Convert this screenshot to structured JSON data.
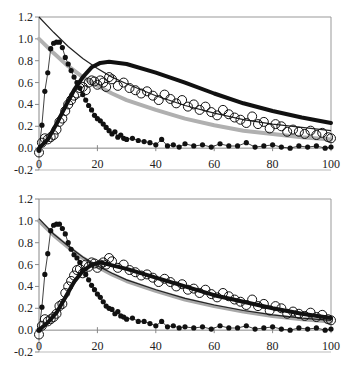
{
  "chart_data": [
    {
      "id": "top",
      "type": "line",
      "title": "",
      "xlabel": "",
      "ylabel": "",
      "xlim": [
        0,
        100
      ],
      "ylim": [
        -0.2,
        1.2
      ],
      "x_ticks": [
        0,
        20,
        40,
        60,
        80,
        100
      ],
      "y_ticks": [
        -0.2,
        0.0,
        0.2,
        0.4,
        0.6,
        0.8,
        1.0,
        1.2
      ],
      "y_tick_labels": [
        "-0.2",
        "0.0",
        "0.2",
        "0.4",
        "0.6",
        "0.8",
        "1.0",
        "1.2"
      ],
      "x_tick_labels": [
        "0",
        "20",
        "40",
        "60",
        "80",
        "100"
      ],
      "grid": false,
      "legend": null,
      "series": [
        {
          "name": "thin-black-decay",
          "style": "thin-line",
          "color": "#222222",
          "x": [
            0,
            5,
            10,
            15,
            20,
            25,
            30,
            40,
            50,
            60,
            70,
            80,
            90,
            100
          ],
          "values": [
            1.2,
            1.06,
            0.93,
            0.82,
            0.73,
            0.65,
            0.59,
            0.48,
            0.39,
            0.32,
            0.26,
            0.22,
            0.19,
            0.16
          ]
        },
        {
          "name": "gray-decay",
          "style": "thick-line",
          "color": "#b0b0b0",
          "x": [
            0,
            5,
            10,
            15,
            20,
            25,
            30,
            40,
            50,
            60,
            70,
            80,
            90,
            100
          ],
          "values": [
            1.0,
            0.87,
            0.75,
            0.65,
            0.57,
            0.5,
            0.44,
            0.35,
            0.27,
            0.21,
            0.16,
            0.13,
            0.1,
            0.08
          ]
        },
        {
          "name": "thick-black-rise-decay",
          "style": "thick-line",
          "color": "#111111",
          "x": [
            0,
            3,
            6,
            9,
            12,
            15,
            18,
            21,
            24,
            30,
            40,
            50,
            60,
            70,
            80,
            90,
            100
          ],
          "values": [
            0.0,
            0.08,
            0.22,
            0.38,
            0.53,
            0.65,
            0.74,
            0.78,
            0.79,
            0.77,
            0.69,
            0.6,
            0.5,
            0.41,
            0.34,
            0.28,
            0.23
          ]
        },
        {
          "name": "filled-dots-fast",
          "style": "filled-dots-line",
          "color": "#111111",
          "x": [
            0,
            1,
            2,
            3,
            4,
            5,
            6,
            7,
            8,
            9,
            10,
            11,
            12,
            13,
            14,
            15,
            16,
            17,
            18,
            19,
            20,
            21,
            22,
            23,
            24,
            25,
            26,
            27,
            28,
            29,
            30,
            32,
            34,
            36,
            38,
            40,
            42,
            44,
            46,
            48,
            50,
            53,
            56,
            59,
            62,
            65,
            68,
            71,
            74,
            77,
            80,
            83,
            86,
            89,
            92,
            95,
            98,
            100
          ],
          "values": [
            -0.02,
            0.21,
            0.52,
            0.69,
            0.91,
            0.96,
            0.97,
            0.97,
            0.92,
            0.83,
            0.77,
            0.71,
            0.65,
            0.6,
            0.55,
            0.49,
            0.44,
            0.39,
            0.35,
            0.3,
            0.27,
            0.25,
            0.22,
            0.19,
            0.16,
            0.13,
            0.15,
            0.1,
            0.12,
            0.09,
            0.08,
            0.09,
            0.07,
            0.06,
            0.05,
            0.03,
            0.08,
            0.02,
            0.03,
            0.01,
            0.04,
            0.02,
            0.03,
            0.01,
            0.04,
            0.02,
            0.02,
            0.05,
            0.01,
            0.02,
            0.03,
            0.01,
            0.0,
            0.02,
            0.01,
            0.02,
            0.0,
            0.01
          ]
        },
        {
          "name": "open-circles",
          "style": "open-circles",
          "color": "#111111",
          "x": [
            0,
            1,
            2,
            3,
            4,
            5,
            6,
            7,
            8,
            9,
            10,
            11,
            12,
            13,
            14,
            15,
            16,
            17,
            18,
            19,
            20,
            21,
            22,
            23,
            24,
            25,
            27,
            29,
            31,
            33,
            35,
            37,
            39,
            41,
            43,
            45,
            47,
            49,
            51,
            53,
            55,
            57,
            59,
            61,
            63,
            65,
            67,
            69,
            71,
            73,
            75,
            77,
            79,
            81,
            83,
            85,
            87,
            89,
            91,
            93,
            95,
            97,
            99,
            100
          ],
          "values": [
            -0.04,
            0.05,
            0.09,
            0.08,
            0.1,
            0.12,
            0.17,
            0.24,
            0.27,
            0.34,
            0.4,
            0.44,
            0.48,
            0.5,
            0.55,
            0.56,
            0.53,
            0.6,
            0.62,
            0.61,
            0.58,
            0.62,
            0.6,
            0.56,
            0.65,
            0.63,
            0.57,
            0.6,
            0.55,
            0.53,
            0.5,
            0.52,
            0.48,
            0.44,
            0.49,
            0.45,
            0.41,
            0.44,
            0.38,
            0.4,
            0.35,
            0.38,
            0.33,
            0.3,
            0.35,
            0.31,
            0.28,
            0.26,
            0.23,
            0.29,
            0.22,
            0.24,
            0.18,
            0.22,
            0.2,
            0.15,
            0.17,
            0.15,
            0.13,
            0.16,
            0.12,
            0.14,
            0.1,
            0.09
          ]
        }
      ]
    },
    {
      "id": "bottom",
      "type": "line",
      "title": "",
      "xlabel": "",
      "ylabel": "",
      "xlim": [
        0,
        100
      ],
      "ylim": [
        -0.2,
        1.2
      ],
      "x_ticks": [
        0,
        20,
        40,
        60,
        80,
        100
      ],
      "y_ticks": [
        -0.2,
        0.0,
        0.2,
        0.4,
        0.6,
        0.8,
        1.0,
        1.2
      ],
      "y_tick_labels": [
        "-0.2",
        "0.0",
        "0.2",
        "0.4",
        "0.6",
        "0.8",
        "1.0",
        "1.2"
      ],
      "x_tick_labels": [
        "0",
        "20",
        "40",
        "60",
        "80",
        "100"
      ],
      "grid": false,
      "legend": null,
      "series": [
        {
          "name": "gray-decay",
          "style": "thick-line",
          "color": "#a8a8a8",
          "x": [
            0,
            5,
            10,
            15,
            20,
            25,
            30,
            40,
            50,
            60,
            70,
            80,
            90,
            100
          ],
          "values": [
            1.0,
            0.87,
            0.76,
            0.66,
            0.58,
            0.51,
            0.45,
            0.36,
            0.28,
            0.22,
            0.17,
            0.13,
            0.1,
            0.08
          ]
        },
        {
          "name": "thin-black-decay",
          "style": "thin-line",
          "color": "#222222",
          "x": [
            0,
            5,
            10,
            15,
            20,
            25,
            30,
            40,
            50,
            60,
            70,
            80,
            90,
            100
          ],
          "values": [
            1.02,
            0.88,
            0.77,
            0.67,
            0.59,
            0.52,
            0.46,
            0.37,
            0.29,
            0.23,
            0.18,
            0.14,
            0.11,
            0.09
          ]
        },
        {
          "name": "black-rise-decay",
          "style": "thick-line",
          "color": "#111111",
          "x": [
            0,
            3,
            6,
            9,
            12,
            15,
            18,
            21,
            24,
            30,
            40,
            50,
            60,
            70,
            80,
            90,
            100
          ],
          "values": [
            0.0,
            0.07,
            0.16,
            0.3,
            0.44,
            0.54,
            0.6,
            0.62,
            0.6,
            0.56,
            0.48,
            0.4,
            0.32,
            0.26,
            0.2,
            0.15,
            0.11
          ]
        },
        {
          "name": "filled-dots-fast",
          "style": "filled-dots-line",
          "color": "#111111",
          "x": [
            0,
            1,
            2,
            3,
            4,
            5,
            6,
            7,
            8,
            9,
            10,
            11,
            12,
            13,
            14,
            15,
            16,
            17,
            18,
            19,
            20,
            21,
            22,
            23,
            24,
            25,
            26,
            27,
            28,
            29,
            30,
            32,
            34,
            36,
            38,
            40,
            42,
            44,
            46,
            48,
            50,
            53,
            56,
            59,
            62,
            65,
            68,
            71,
            74,
            77,
            80,
            83,
            86,
            89,
            92,
            95,
            98,
            100
          ],
          "values": [
            0.0,
            0.21,
            0.51,
            0.7,
            0.91,
            0.96,
            0.97,
            0.97,
            0.93,
            0.88,
            0.8,
            0.74,
            0.69,
            0.66,
            0.62,
            0.55,
            0.51,
            0.46,
            0.41,
            0.37,
            0.33,
            0.3,
            0.26,
            0.22,
            0.2,
            0.19,
            0.15,
            0.17,
            0.13,
            0.12,
            0.1,
            0.11,
            0.08,
            0.08,
            0.06,
            0.04,
            0.08,
            0.03,
            0.04,
            0.02,
            0.03,
            0.02,
            0.03,
            0.01,
            0.04,
            0.02,
            0.02,
            0.04,
            0.01,
            0.02,
            0.03,
            0.01,
            0.0,
            0.02,
            0.01,
            0.02,
            0.0,
            0.01
          ]
        },
        {
          "name": "open-circles",
          "style": "open-circles",
          "color": "#111111",
          "x": [
            0,
            1,
            2,
            3,
            4,
            5,
            6,
            7,
            8,
            9,
            10,
            11,
            12,
            13,
            14,
            15,
            16,
            17,
            18,
            19,
            20,
            21,
            22,
            23,
            24,
            25,
            27,
            29,
            31,
            33,
            35,
            37,
            39,
            41,
            43,
            45,
            47,
            49,
            51,
            53,
            55,
            57,
            59,
            61,
            63,
            65,
            67,
            69,
            71,
            73,
            75,
            77,
            79,
            81,
            83,
            85,
            87,
            89,
            91,
            93,
            95,
            97,
            99,
            100
          ],
          "values": [
            -0.04,
            0.04,
            0.1,
            0.08,
            0.1,
            0.12,
            0.15,
            0.22,
            0.24,
            0.34,
            0.4,
            0.45,
            0.5,
            0.55,
            0.56,
            0.52,
            0.6,
            0.58,
            0.62,
            0.61,
            0.57,
            0.6,
            0.62,
            0.6,
            0.66,
            0.63,
            0.57,
            0.6,
            0.55,
            0.53,
            0.5,
            0.51,
            0.48,
            0.44,
            0.47,
            0.44,
            0.4,
            0.42,
            0.37,
            0.38,
            0.34,
            0.37,
            0.33,
            0.3,
            0.34,
            0.31,
            0.28,
            0.26,
            0.23,
            0.28,
            0.22,
            0.24,
            0.18,
            0.22,
            0.2,
            0.15,
            0.17,
            0.15,
            0.13,
            0.16,
            0.12,
            0.14,
            0.1,
            0.09
          ]
        }
      ]
    }
  ],
  "layout": {
    "panels": [
      {
        "id": "top",
        "plot_left": 39,
        "plot_right": 331,
        "y_top_px": 17,
        "y_bottom_px": 170
      },
      {
        "id": "bottom",
        "plot_left": 39,
        "plot_right": 331,
        "y_top_px": 199,
        "y_bottom_px": 352
      }
    ]
  }
}
